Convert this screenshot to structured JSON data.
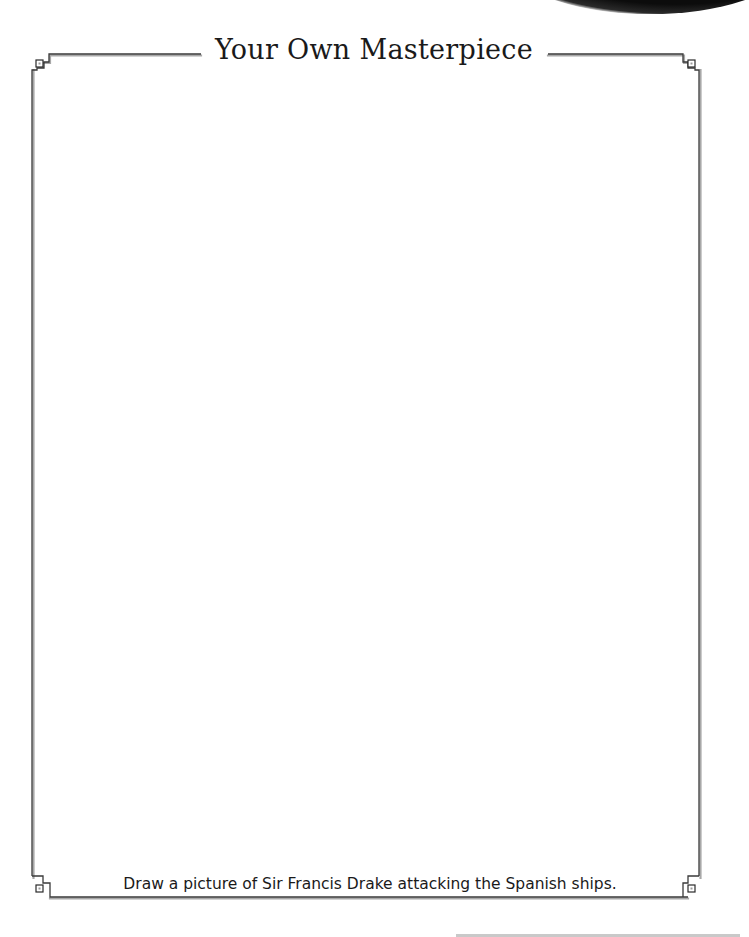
{
  "worksheet": {
    "title": "Your Own Masterpiece",
    "caption": "Draw a picture of Sir Francis Drake attacking the Spanish ships.",
    "drawing_area_label": "blank drawing area"
  },
  "style": {
    "border_color": "#3a3a3a",
    "border_shadow_color": "#9a9a9a",
    "text_color": "#1a1a1a",
    "background": "#ffffff"
  },
  "decorations": {
    "corner_icon": "square-knot-corner",
    "scan_artifact": "dark-curved-edge",
    "bottom_rule": "gray-line"
  }
}
